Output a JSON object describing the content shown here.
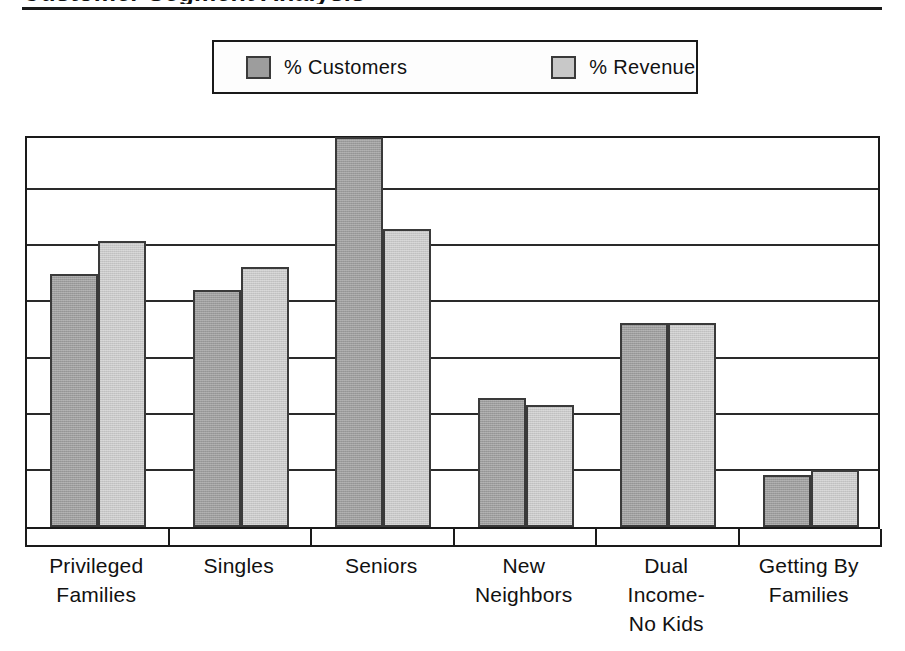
{
  "title": "Customer Segment Analysis",
  "legend": {
    "position": "top-center",
    "entries": [
      {
        "label": "% Customers",
        "color": "#9d9d9d",
        "name": "customers"
      },
      {
        "label": "% Revenue",
        "color": "#c8c8c8",
        "name": "revenue"
      }
    ]
  },
  "chart_data": {
    "type": "bar",
    "title": "Customer Segment Analysis",
    "xlabel": "",
    "ylabel": "",
    "grid": true,
    "legend_position": "top-center",
    "axis_tick_labels_visible": false,
    "ylim": [
      0,
      35
    ],
    "gridline_values": [
      5,
      10,
      15,
      20,
      25,
      30,
      35
    ],
    "categories": [
      "Privileged Families",
      "Singles",
      "Seniors",
      "New Neighbors",
      "Dual Income-No Kids",
      "Getting By Families"
    ],
    "category_label_lines": [
      [
        "Privileged",
        "Families"
      ],
      [
        "Singles"
      ],
      [
        "Seniors"
      ],
      [
        "New",
        "Neighbors"
      ],
      [
        "Dual",
        "Income-",
        "No Kids"
      ],
      [
        "Getting By",
        "Families"
      ]
    ],
    "series": [
      {
        "name": "% Customers",
        "color": "#9d9d9d",
        "values": [
          22.5,
          21.1,
          34.7,
          11.5,
          18.2,
          4.6
        ]
      },
      {
        "name": "% Revenue",
        "color": "#c8c8c8",
        "values": [
          25.5,
          23.2,
          26.5,
          10.9,
          18.2,
          5.1
        ]
      }
    ]
  },
  "colors": {
    "customers": "#9d9d9d",
    "revenue": "#c8c8c8",
    "border": "#1a1a1a",
    "gridline": "#2a2a2a",
    "background": "#ffffff"
  }
}
